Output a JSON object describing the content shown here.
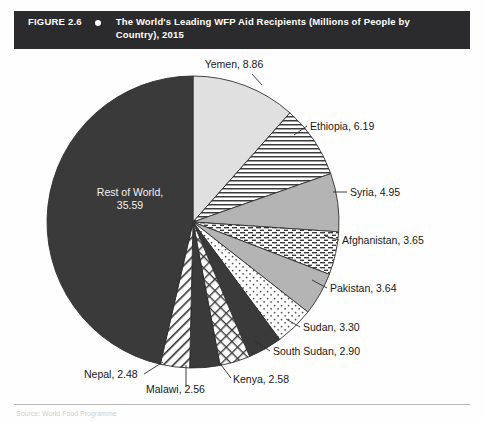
{
  "figure": {
    "number_label": "FIGURE 2.6",
    "bullet_icon": "bullet-dot-icon",
    "title": "The World's Leading WFP Aid Recipients (Millions of People by Country), 2015",
    "source_note": "Source: World Food Programme"
  },
  "colors": {
    "header_background": "#2b2b2d",
    "header_text": "#ffffff",
    "slice_dark": "#3a3a3a",
    "slice_light_gray": "#e0e0e0",
    "slice_mid_gray": "#b4b4b4",
    "slice_white": "#ffffff",
    "outline": "#2f2f2f",
    "label_text": "#181818",
    "inner_label_text": "#f2f2f2"
  },
  "chart_data": {
    "type": "pie",
    "title": "The World's Leading WFP Aid Recipients (Millions of People by Country), 2015",
    "unit": "millions of people",
    "value_total": 76.64,
    "start_angle_deg": 0,
    "direction": "clockwise",
    "legend": "none",
    "labels_mode": "callout-labels-with-leader-lines",
    "categories": [
      "Yemen",
      "Ethiopia",
      "Syria",
      "Afghanistan",
      "Pakistan",
      "Sudan",
      "South Sudan",
      "Kenya",
      "Malawi",
      "Nepal",
      "Rest of World"
    ],
    "values": [
      8.86,
      6.19,
      4.95,
      3.65,
      3.64,
      3.3,
      2.9,
      2.58,
      2.56,
      2.48,
      35.59
    ],
    "slices": [
      {
        "name": "Yemen",
        "value": 8.86,
        "label": "Yemen, 8.86",
        "fill": "light-gray",
        "pattern": "solid",
        "label_x": 234,
        "label_y": 16,
        "label_anchor": "middle",
        "leader": "M 252 22 L 262 33"
      },
      {
        "name": "Ethiopia",
        "value": 6.19,
        "label": "Ethiopia, 6.19",
        "fill": "white",
        "pattern": "horizontal-lines",
        "label_x": 310,
        "label_y": 78,
        "label_anchor": "start",
        "leader": "M 307 74 L 294 83"
      },
      {
        "name": "Syria",
        "value": 4.95,
        "label": "Syria, 4.95",
        "fill": "mid-gray",
        "pattern": "solid",
        "label_x": 350,
        "label_y": 144,
        "label_anchor": "start",
        "leader": "M 347 140 L 333 140"
      },
      {
        "name": "Afghanistan",
        "value": 3.65,
        "label": "Afghanistan, 3.65",
        "fill": "white",
        "pattern": "dashed-lines",
        "label_x": 342,
        "label_y": 192,
        "label_anchor": "start",
        "leader": "M 339 188 L 325 184"
      },
      {
        "name": "Pakistan",
        "value": 3.64,
        "label": "Pakistan, 3.64",
        "fill": "mid-gray",
        "pattern": "solid",
        "label_x": 330,
        "label_y": 240,
        "label_anchor": "start",
        "leader": "M 327 236 L 312 228"
      },
      {
        "name": "Sudan",
        "value": 3.3,
        "label": "Sudan, 3.30",
        "fill": "white",
        "pattern": "dots",
        "label_x": 303,
        "label_y": 279,
        "label_anchor": "start",
        "leader": "M 300 275 L 286 267"
      },
      {
        "name": "South Sudan",
        "value": 2.9,
        "label": "South Sudan, 2.90",
        "fill": "dark",
        "pattern": "solid",
        "label_x": 273,
        "label_y": 303,
        "label_anchor": "start",
        "leader": "M 270 299 L 255 289"
      },
      {
        "name": "Kenya",
        "value": 2.58,
        "label": "Kenya, 2.58",
        "fill": "white",
        "pattern": "cross-hatch",
        "label_x": 233,
        "label_y": 331,
        "label_anchor": "start",
        "leader": "M 231 326 L 218 309"
      },
      {
        "name": "Malawi",
        "value": 2.56,
        "label": "Malawi, 2.56",
        "fill": "dark",
        "pattern": "solid",
        "label_x": 146,
        "label_y": 341,
        "label_anchor": "start",
        "leader": "M 186 334 L 186 313"
      },
      {
        "name": "Nepal",
        "value": 2.48,
        "label": "Nepal, 2.48",
        "fill": "white",
        "pattern": "diagonal-lines",
        "label_x": 84,
        "label_y": 326,
        "label_anchor": "start",
        "leader": "M 144 322 L 163 310"
      },
      {
        "name": "Rest of World",
        "value": 35.59,
        "label": "Rest of World,",
        "label_line2": "35.59",
        "fill": "dark",
        "pattern": "solid",
        "label_x": 130,
        "label_y": 144,
        "label_anchor": "middle",
        "inside": true
      }
    ]
  }
}
